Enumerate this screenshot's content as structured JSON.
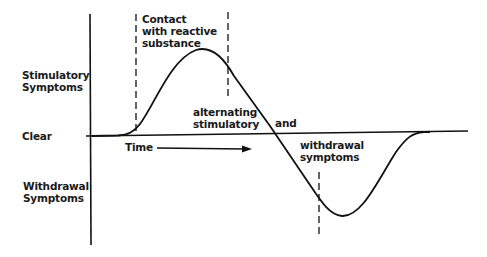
{
  "diagram": {
    "y_axis_labels": {
      "stimulatory_line1": "Stimulatory",
      "stimulatory_line2": "Symptoms",
      "clear": "Clear",
      "withdrawal_line1": "Withdrawal",
      "withdrawal_line2": "Symptoms"
    },
    "x_axis_label": "Time",
    "annotations": {
      "contact_line1": "Contact",
      "contact_line2": "with reactive",
      "contact_line3": "substance",
      "alternating_line1": "alternating",
      "alternating_line2": "stimulatory",
      "and": "and",
      "withdrawal_line1": "withdrawal",
      "withdrawal_line2": "symptoms"
    },
    "colors": {
      "line": "#111111",
      "background": "#ffffff"
    }
  }
}
